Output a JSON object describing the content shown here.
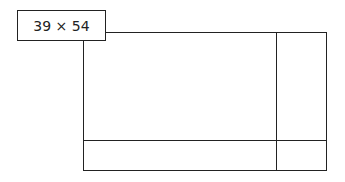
{
  "diagram": {
    "dimension_label": "39 × 54",
    "line_color": "#222222"
  }
}
